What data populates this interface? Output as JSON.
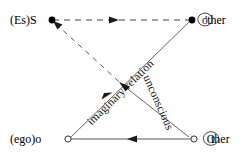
{
  "diagram": {
    "type": "lacan-schema-l",
    "background_color": "#ffffff",
    "line_color": "#333333",
    "text_color": "#000000",
    "nodes": [
      {
        "id": "es-s",
        "label": "(Es)S",
        "position": "top-left",
        "marker": "filled-dot",
        "marker_color": "#000000"
      },
      {
        "id": "little-other",
        "label": "'ther",
        "circled_glyph": "o",
        "position": "top-right",
        "marker": "filled-dot",
        "marker_color": "#000000"
      },
      {
        "id": "ego-o",
        "label": "(ego)o",
        "position": "bottom-left",
        "marker": "hollow-circle",
        "marker_color": "#ffffff"
      },
      {
        "id": "big-Other",
        "label": "ther",
        "circled_glyph": "O",
        "position": "bottom-right",
        "marker": "hollow-circle",
        "marker_color": "#ffffff"
      }
    ],
    "edges": [
      {
        "id": "s-to-other-top",
        "from": "es-s",
        "to": "little-other",
        "style": "dashed",
        "arrow": "toward-little-other"
      },
      {
        "id": "s-to-center-dashed",
        "from": "es-s",
        "to": "center-crossing",
        "style": "dashed",
        "arrow": "toward-es-s"
      },
      {
        "id": "ego-to-other-imaginary",
        "from": "ego-o",
        "to": "little-other",
        "style": "solid",
        "arrow": "toward-ego-o",
        "label": "imaginary relation"
      },
      {
        "id": "Other-to-s-unconscious",
        "from": "big-Other",
        "to": "es-s",
        "style": "solid",
        "arrow": "toward-es-s",
        "label": "unconscious"
      },
      {
        "id": "Other-to-ego-bottom",
        "from": "big-Other",
        "to": "ego-o",
        "style": "solid",
        "arrow": "toward-ego-o"
      }
    ],
    "edge_labels": {
      "imaginary_relation": "imaginary relation",
      "unconscious": "unconscious"
    }
  }
}
